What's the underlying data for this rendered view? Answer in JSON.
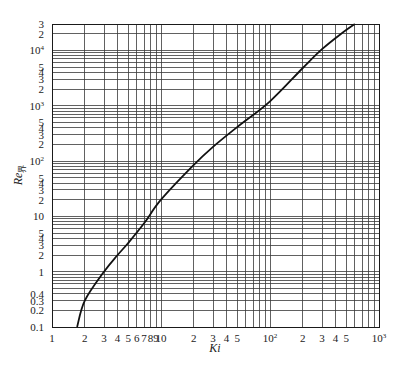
{
  "chart_data": {
    "type": "line",
    "title": "",
    "xlabel": "Ki",
    "ylabel": "Re",
    "ylabel_subscript": "界",
    "xscale": "log",
    "yscale": "log",
    "xlim": [
      1,
      1000
    ],
    "ylim": [
      0.1,
      30000
    ],
    "grid": true,
    "legend": null,
    "x_tick_labels": [
      {
        "v": 1,
        "t": "1"
      },
      {
        "v": 2,
        "t": "2"
      },
      {
        "v": 3,
        "t": "3"
      },
      {
        "v": 4,
        "t": "4"
      },
      {
        "v": 5,
        "t": "5"
      },
      {
        "v": 6,
        "t": "6"
      },
      {
        "v": 7,
        "t": "7"
      },
      {
        "v": 8,
        "t": "8"
      },
      {
        "v": 9,
        "t": "9"
      },
      {
        "v": 10,
        "t": "10"
      },
      {
        "v": 20,
        "t": "2"
      },
      {
        "v": 30,
        "t": "3"
      },
      {
        "v": 40,
        "t": "4"
      },
      {
        "v": 50,
        "t": "5"
      },
      {
        "v": 100,
        "t": "10",
        "sup": "2"
      },
      {
        "v": 200,
        "t": "2"
      },
      {
        "v": 300,
        "t": "3"
      },
      {
        "v": 400,
        "t": "4"
      },
      {
        "v": 500,
        "t": "5"
      },
      {
        "v": 1000,
        "t": "10",
        "sup": "3"
      }
    ],
    "y_tick_labels": [
      {
        "v": 0.1,
        "t": "0.1"
      },
      {
        "v": 0.2,
        "t": "0.2"
      },
      {
        "v": 0.3,
        "t": "0.3"
      },
      {
        "v": 0.4,
        "t": "0.4"
      },
      {
        "v": 1,
        "t": "1"
      },
      {
        "v": 2,
        "t": "2"
      },
      {
        "v": 3,
        "t": "3"
      },
      {
        "v": 4,
        "t": "4"
      },
      {
        "v": 5,
        "t": "5"
      },
      {
        "v": 10,
        "t": "10"
      },
      {
        "v": 20,
        "t": "2"
      },
      {
        "v": 30,
        "t": "3"
      },
      {
        "v": 40,
        "t": "4"
      },
      {
        "v": 50,
        "t": "5"
      },
      {
        "v": 100,
        "t": "10",
        "sup": "2"
      },
      {
        "v": 200,
        "t": "2"
      },
      {
        "v": 300,
        "t": "3"
      },
      {
        "v": 400,
        "t": "4"
      },
      {
        "v": 500,
        "t": "5"
      },
      {
        "v": 1000,
        "t": "10",
        "sup": "3"
      },
      {
        "v": 2000,
        "t": "2"
      },
      {
        "v": 3000,
        "t": "3"
      },
      {
        "v": 4000,
        "t": "4"
      },
      {
        "v": 5000,
        "t": "5"
      },
      {
        "v": 10000,
        "t": "10",
        "sup": "4"
      },
      {
        "v": 20000,
        "t": "2"
      },
      {
        "v": 30000,
        "t": "3"
      }
    ],
    "series": [
      {
        "name": "Re界 vs Ki",
        "x": [
          1.7,
          2,
          3,
          4,
          5,
          7,
          10,
          20,
          30,
          50,
          100,
          200,
          300,
          450,
          600
        ],
        "y": [
          0.1,
          0.3,
          1,
          2,
          3.3,
          7.5,
          20,
          85,
          180,
          410,
          1200,
          4800,
          10500,
          20000,
          30000
        ]
      }
    ]
  },
  "layout": {
    "plot_left": 52,
    "plot_right": 379,
    "plot_top": 24,
    "plot_bottom": 327
  }
}
